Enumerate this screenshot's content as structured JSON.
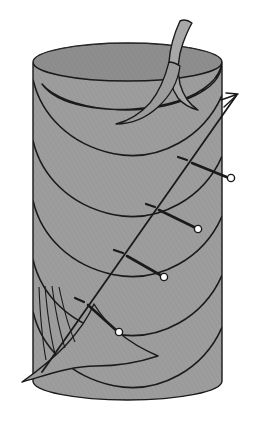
{
  "figure": {
    "type": "geometric-diagram",
    "canvas": {
      "width": 257,
      "height": 429,
      "background": "#ffffff"
    },
    "colors": {
      "surface_fill": "#9b9b9b",
      "surface_fill_light": "#a8a8a8",
      "surface_fill_dark": "#8c8c8c",
      "stroke": "#1a1a1a",
      "marker_fill": "#ffffff",
      "background": "#ffffff"
    },
    "stroke_widths": {
      "outline": 1.4,
      "contour": 1.6,
      "helix": 1.8,
      "normal_vector": 2.6,
      "tick": 2.2,
      "marker_outline": 1.4
    },
    "cylinder": {
      "label": "cylinder",
      "left_x": 33,
      "right_x": 222,
      "top_center_y": 62,
      "bottom_center_y": 381,
      "radius_x": 94.5,
      "radius_y": 19
    },
    "spiral_turns": [
      {
        "id": 1,
        "center_y": 120,
        "label": "spiral-edge-1"
      },
      {
        "id": 2,
        "center_y": 181,
        "label": "spiral-edge-2"
      },
      {
        "id": 3,
        "center_y": 241,
        "label": "spiral-edge-3"
      },
      {
        "id": 4,
        "center_y": 300,
        "label": "spiral-edge-4"
      },
      {
        "id": 5,
        "center_y": 352,
        "label": "spiral-edge-5"
      }
    ],
    "helix_line": {
      "label": "helix-geodesic",
      "start": {
        "x": 42,
        "y": 372
      },
      "end": {
        "x": 236,
        "y": 96
      },
      "has_arrowhead": true,
      "arrow_at": "end"
    },
    "nodes": [
      {
        "id": 1,
        "label": "node-1",
        "point": {
          "x": 192,
          "y": 163
        },
        "tick": {
          "x1": 178,
          "y1": 157,
          "x2": 187,
          "y2": 160
        },
        "vector_end": {
          "x": 229,
          "y": 178
        },
        "marker": {
          "x": 231,
          "y": 178,
          "r": 3.6
        }
      },
      {
        "id": 2,
        "label": "node-2",
        "point": {
          "x": 159,
          "y": 210
        },
        "tick": {
          "x1": 146,
          "y1": 204,
          "x2": 155,
          "y2": 207
        },
        "vector_end": {
          "x": 196,
          "y": 228
        },
        "marker": {
          "x": 198,
          "y": 229,
          "r": 3.6
        }
      },
      {
        "id": 3,
        "label": "node-3",
        "point": {
          "x": 127,
          "y": 256
        },
        "tick": {
          "x1": 114,
          "y1": 250,
          "x2": 123,
          "y2": 253
        },
        "vector_end": {
          "x": 162,
          "y": 276
        },
        "marker": {
          "x": 164,
          "y": 277,
          "r": 3.6
        }
      },
      {
        "id": 4,
        "label": "node-4",
        "point": {
          "x": 88,
          "y": 305
        },
        "tick": {
          "x1": 75,
          "y1": 298,
          "x2": 84,
          "y2": 302
        },
        "vector_end": {
          "x": 117,
          "y": 331
        },
        "marker": {
          "x": 119,
          "y": 332,
          "r": 3.6
        }
      }
    ],
    "top_flap": {
      "label": "top-spiral-flap",
      "spike_tip": {
        "x": 180,
        "y": 21
      },
      "description": "curved horn-shaped flap rising above top rim"
    },
    "bottom_flap": {
      "label": "bottom-spiral-flap",
      "tip": {
        "x": 22,
        "y": 382
      },
      "description": "flared skirt emerging from lower-left of cylinder"
    },
    "fold_lines_count": 4
  }
}
